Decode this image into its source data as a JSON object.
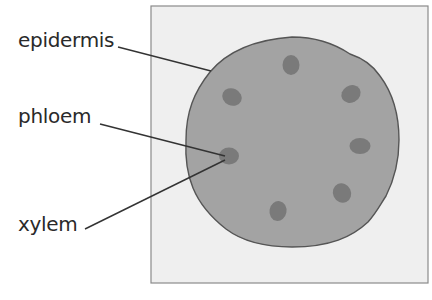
{
  "diagram": {
    "type": "stem-cross-section",
    "labels": [
      {
        "id": "epidermis",
        "text": "epidermis"
      },
      {
        "id": "phloem",
        "text": "phloem"
      },
      {
        "id": "xylem",
        "text": "xylem"
      }
    ],
    "vascular_bundle_count": 7,
    "colors": {
      "box_fill": "#efefef",
      "box_border": "#8a8a8a",
      "stem_fill": "#a3a3a3",
      "stem_border": "#555555",
      "bundle_fill": "#7a7a7a",
      "leader_line": "#333333",
      "label_text": "#2a2a2a"
    }
  }
}
